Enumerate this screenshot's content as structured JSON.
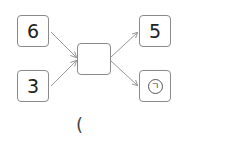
{
  "diagram": {
    "inputs": [
      {
        "label": "6"
      },
      {
        "label": "3"
      }
    ],
    "center": {
      "label": ""
    },
    "outputs": [
      {
        "label": "5"
      },
      {
        "label": "ㄱ",
        "circled": true
      }
    ],
    "answer_paren": "("
  }
}
